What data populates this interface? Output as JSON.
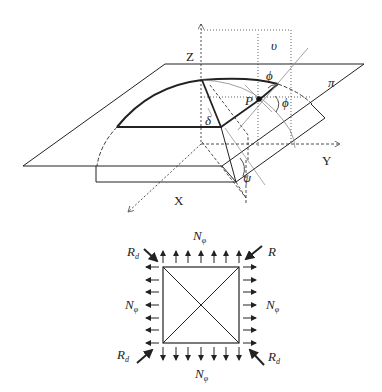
{
  "figure": {
    "top_diagram": {
      "axes": {
        "z": "Z",
        "y": "Y",
        "x": "X"
      },
      "labels": {
        "upsilon": "υ",
        "phi_top": "ϕ",
        "phi_right": "ϕ",
        "point": "P",
        "plane": "π",
        "delta": "δ",
        "psi": "ψ"
      }
    },
    "bottom_diagram": {
      "labels": {
        "n_top": "N",
        "n_left": "N",
        "n_right": "N",
        "n_bottom": "N",
        "n_sub": "φ",
        "r_top_left": "R",
        "r_top_right": "R",
        "r_bottom_left": "R",
        "r_bottom_right": "R",
        "r_sub": "d"
      }
    }
  }
}
